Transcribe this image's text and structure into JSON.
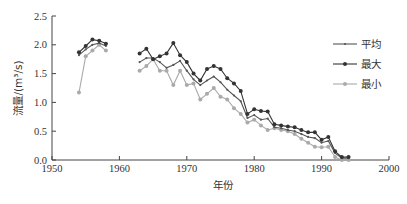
{
  "chart_data": {
    "type": "line",
    "title": "",
    "xlabel": "年份",
    "ylabel": "流量/(m³/s)",
    "xlim": [
      1950,
      2000
    ],
    "ylim": [
      0,
      2.5
    ],
    "xticks": [
      "1950",
      "1960",
      "1970",
      "1980",
      "1990",
      "2000"
    ],
    "yticks": [
      "0.0",
      "0.5",
      "1.0",
      "1.5",
      "2.0",
      "2.5"
    ],
    "grid": false,
    "legend_position": "right",
    "series": [
      {
        "name": "平均",
        "color": "#555555",
        "marker": "small-dot",
        "segments": [
          {
            "x": [
              1954,
              1955,
              1956,
              1957,
              1958
            ],
            "y": [
              1.82,
              1.92,
              2.0,
              2.03,
              1.98
            ]
          },
          {
            "x": [
              1963,
              1964,
              1965,
              1966,
              1967,
              1968,
              1969,
              1970,
              1971,
              1972,
              1973,
              1974,
              1975,
              1976,
              1977,
              1978,
              1979,
              1980,
              1981,
              1982,
              1983,
              1984,
              1985,
              1986,
              1987,
              1988,
              1989,
              1990,
              1991,
              1992,
              1993,
              1994
            ],
            "y": [
              1.7,
              1.77,
              1.77,
              1.7,
              1.6,
              1.65,
              1.72,
              1.55,
              1.4,
              1.3,
              1.38,
              1.45,
              1.35,
              1.22,
              1.12,
              1.02,
              0.73,
              0.78,
              0.7,
              0.72,
              0.57,
              0.55,
              0.52,
              0.5,
              0.45,
              0.4,
              0.38,
              0.3,
              0.33,
              0.12,
              0.03,
              0.03
            ]
          }
        ]
      },
      {
        "name": "最大",
        "color": "#333333",
        "marker": "filled-circle",
        "segments": [
          {
            "x": [
              1954,
              1955,
              1956,
              1957,
              1958
            ],
            "y": [
              1.87,
              1.98,
              2.09,
              2.07,
              2.02
            ]
          },
          {
            "x": [
              1963,
              1964,
              1965,
              1966,
              1967,
              1968,
              1969,
              1970,
              1971,
              1972,
              1973,
              1974,
              1975,
              1976,
              1977,
              1978,
              1979,
              1980,
              1981,
              1982,
              1983,
              1984,
              1985,
              1986,
              1987,
              1988,
              1989,
              1990,
              1991,
              1992,
              1993,
              1994
            ],
            "y": [
              1.85,
              1.93,
              1.75,
              1.8,
              1.85,
              2.03,
              1.82,
              1.7,
              1.5,
              1.38,
              1.58,
              1.63,
              1.58,
              1.42,
              1.33,
              1.2,
              0.8,
              0.88,
              0.85,
              0.84,
              0.62,
              0.6,
              0.58,
              0.57,
              0.52,
              0.48,
              0.48,
              0.35,
              0.4,
              0.15,
              0.05,
              0.05
            ]
          }
        ]
      },
      {
        "name": "最小",
        "color": "#aaaaaa",
        "marker": "filled-circle",
        "segments": [
          {
            "x": [
              1954,
              1955,
              1956,
              1957,
              1958
            ],
            "y": [
              1.17,
              1.8,
              1.9,
              2.0,
              1.9
            ]
          },
          {
            "x": [
              1963,
              1964,
              1965,
              1966,
              1967,
              1968,
              1969,
              1970,
              1971,
              1972,
              1973,
              1974,
              1975,
              1976,
              1977,
              1978,
              1979,
              1980,
              1981,
              1982,
              1983,
              1984,
              1985,
              1986,
              1987,
              1988,
              1989,
              1990,
              1991,
              1992,
              1993,
              1994
            ],
            "y": [
              1.55,
              1.63,
              1.75,
              1.55,
              1.55,
              1.3,
              1.55,
              1.3,
              1.33,
              1.05,
              1.15,
              1.25,
              1.1,
              1.05,
              0.9,
              0.8,
              0.65,
              0.7,
              0.6,
              0.52,
              0.55,
              0.52,
              0.5,
              0.45,
              0.37,
              0.3,
              0.23,
              0.22,
              0.23,
              0.05,
              0.0,
              0.0
            ]
          }
        ]
      }
    ]
  },
  "legend": {
    "items": [
      {
        "label": "平均",
        "color": "#555555"
      },
      {
        "label": "最大",
        "color": "#333333"
      },
      {
        "label": "最小",
        "color": "#aaaaaa"
      }
    ]
  },
  "axes": {
    "xlabel": "年份",
    "ylabel_cn": "流量",
    "ylabel_unit": "/(m³/s)"
  }
}
